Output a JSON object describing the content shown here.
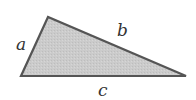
{
  "figure": {
    "type": "triangle",
    "vertices": {
      "top": [
        48,
        17
      ],
      "bottom_left": [
        21,
        76
      ],
      "bottom_right": [
        186,
        76
      ]
    },
    "fill_color": "#c9c9c9",
    "stroke_color": "#555555",
    "labels": {
      "a": "a",
      "b": "b",
      "c": "c"
    }
  }
}
